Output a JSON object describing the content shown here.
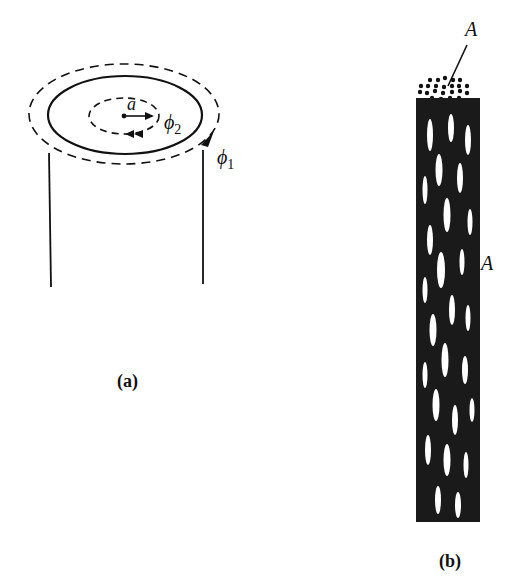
{
  "figure_a": {
    "caption": "(a)",
    "label_radius": "a",
    "label_phi2": "ϕ",
    "label_phi2_sub": "2",
    "label_phi1": "ϕ",
    "label_phi1_sub": "1"
  },
  "figure_b": {
    "caption": "(b)",
    "label_top": "A",
    "label_side": "A"
  },
  "colors": {
    "ink": "#111111",
    "background": "#ffffff"
  }
}
